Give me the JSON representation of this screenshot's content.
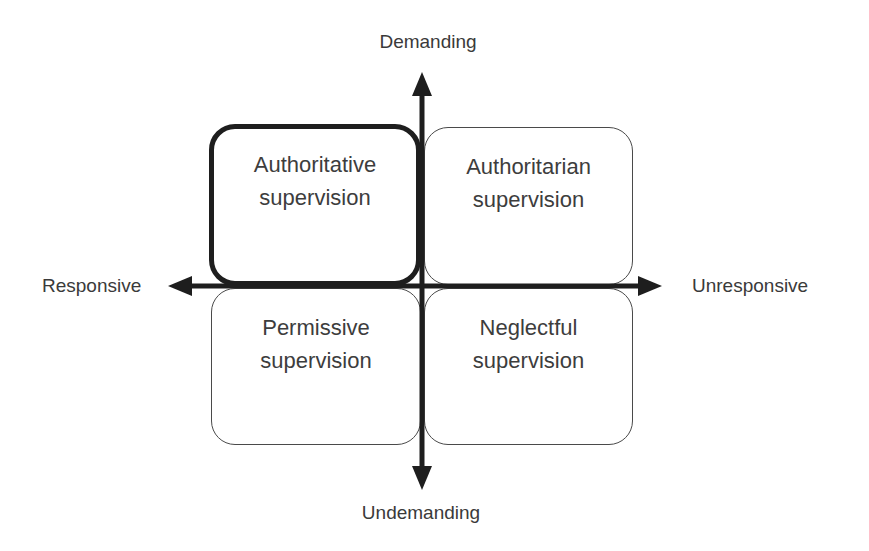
{
  "diagram": {
    "type": "quadrant",
    "axes": {
      "vertical": {
        "top_label": "Demanding",
        "bottom_label": "Undemanding"
      },
      "horizontal": {
        "left_label": "Responsive",
        "right_label": "Unresponsive"
      }
    },
    "quadrants": [
      {
        "position": "top-left",
        "line1": "Authoritative",
        "line2": "supervision",
        "highlighted": true
      },
      {
        "position": "top-right",
        "line1": "Authoritarian",
        "line2": "supervision",
        "highlighted": false
      },
      {
        "position": "bottom-left",
        "line1": "Permissive",
        "line2": "supervision",
        "highlighted": false
      },
      {
        "position": "bottom-right",
        "line1": "Neglectful",
        "line2": "supervision",
        "highlighted": false
      }
    ],
    "colors": {
      "axis": "#1e1e1e",
      "box_border": "#4a4a4a",
      "highlight_border": "#1e1e1e",
      "text": "#3a3a3a",
      "background": "#ffffff"
    }
  }
}
